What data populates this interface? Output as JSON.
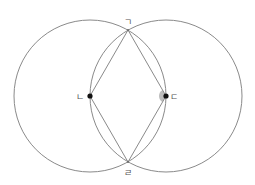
{
  "diagram": {
    "colors": {
      "background": "#ffffff",
      "stroke": "#8a8a8a",
      "point": "#111111",
      "angle_marker": "#bdbdbd",
      "label": "#555555"
    },
    "circles": [
      {
        "name": "left-circle",
        "cx": 90,
        "cy": 96,
        "r": 76
      },
      {
        "name": "right-circle",
        "cx": 166,
        "cy": 96,
        "r": 76
      }
    ],
    "points": {
      "top": {
        "label": "ㄱ",
        "x": 128,
        "y": 30
      },
      "left": {
        "label": "ㄴ",
        "x": 90,
        "y": 96
      },
      "right": {
        "label": "ㄷ",
        "x": 166,
        "y": 96
      },
      "bottom": {
        "label": "ㄹ",
        "x": 128,
        "y": 162
      }
    },
    "segments": [
      [
        "top",
        "left"
      ],
      [
        "left",
        "bottom"
      ],
      [
        "bottom",
        "right"
      ],
      [
        "right",
        "top"
      ]
    ],
    "angle_marker": {
      "at": "right",
      "between": [
        "top",
        "bottom"
      ]
    }
  }
}
